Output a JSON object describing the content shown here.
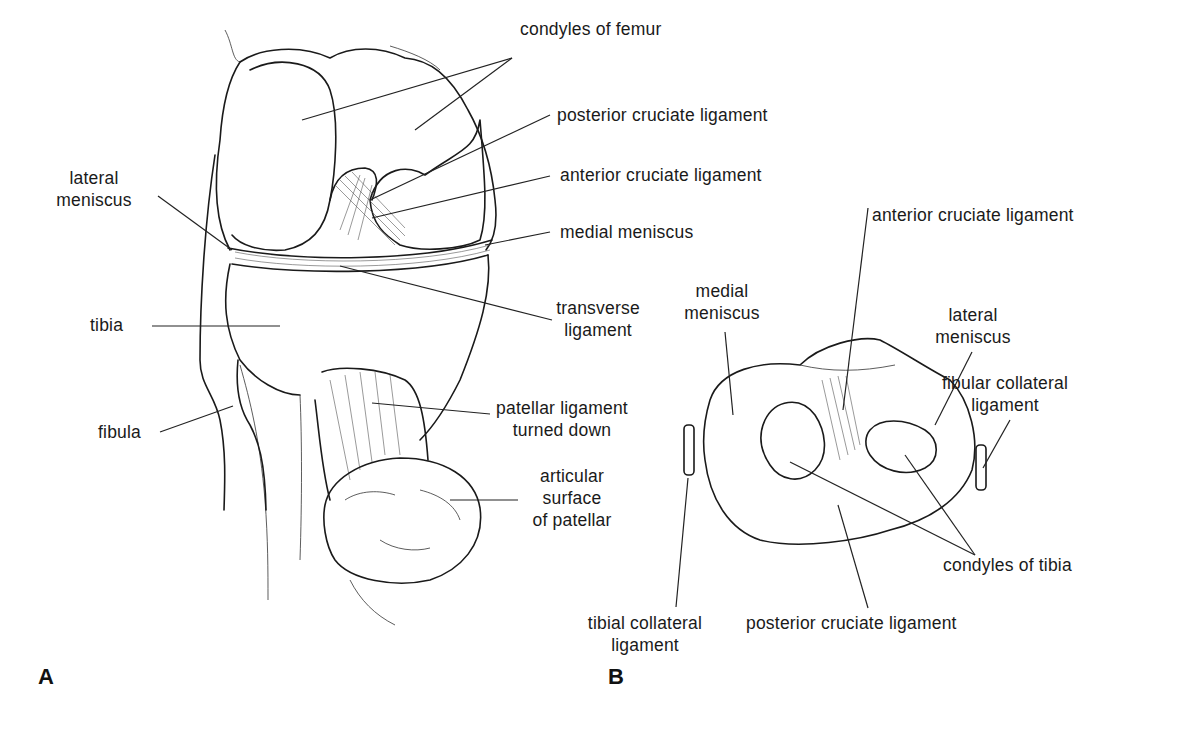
{
  "figure": {
    "panels": [
      {
        "letter": "A",
        "view": "anterior view of knee joint",
        "labels": {
          "condyles_of_femur": "condyles of femur",
          "posterior_cruciate_ligament": "posterior cruciate ligament",
          "anterior_cruciate_ligament": "anterior cruciate ligament",
          "medial_meniscus": "medial meniscus",
          "lateral_meniscus_line1": "lateral",
          "lateral_meniscus_line2": "meniscus",
          "transverse_ligament_line1": "transverse",
          "transverse_ligament_line2": "ligament",
          "tibia": "tibia",
          "fibula": "fibula",
          "patellar_ligament_line1": "patellar ligament",
          "patellar_ligament_line2": "turned down",
          "articular_surface_line1": "articular",
          "articular_surface_line2": "surface",
          "articular_surface_line3": "of patellar"
        }
      },
      {
        "letter": "B",
        "view": "superior view of tibial plateau",
        "labels": {
          "anterior_cruciate_ligament": "anterior cruciate ligament",
          "medial_meniscus_line1": "medial",
          "medial_meniscus_line2": "meniscus",
          "lateral_meniscus_line1": "lateral",
          "lateral_meniscus_line2": "meniscus",
          "fibular_collateral_line1": "fibular collateral",
          "fibular_collateral_line2": "ligament",
          "condyles_of_tibia": "condyles of tibia",
          "tibial_collateral_line1": "tibial collateral",
          "tibial_collateral_line2": "ligament",
          "posterior_cruciate_ligament": "posterior cruciate ligament"
        }
      }
    ]
  }
}
